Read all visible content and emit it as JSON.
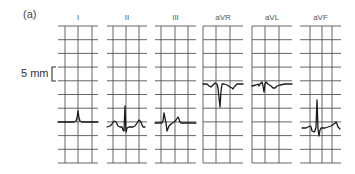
{
  "figure": {
    "label": "(a)",
    "scale_label": "5 mm",
    "colors": {
      "grid": "#555555",
      "trace": "#1a1a1a",
      "background": "#ffffff",
      "text": "#444444"
    },
    "grid": {
      "top": 26,
      "bottom": 163,
      "rows": 10,
      "row_spacing": 13.7
    },
    "scale_bracket": {
      "x": 52,
      "y_top": 67,
      "y_bottom": 81
    },
    "leads": [
      {
        "name": "I",
        "x0": 58,
        "x1": 98,
        "vlines": [
          65,
          78,
          92
        ],
        "trace": "58,122 74,122 76,121 77,118 78,111 79,118 80,121 82,122 98,122"
      },
      {
        "name": "II",
        "x0": 107,
        "x1": 147,
        "vlines": [
          113,
          126,
          139
        ],
        "trace": "107,127 110,126 112,124 114,121 116,122 118,126 120,127 122,127 123,130 124,131 125,106 126,132 127,128 129,127 133,127 135,126 137,123 139,120 141,122 142,125 143,127 145,127"
      },
      {
        "name": "III",
        "x0": 155,
        "x1": 196,
        "vlines": [
          161,
          175,
          188
        ],
        "trace": "155,123 162,123 163,121 164,113 166,123 167,131 169,126 171,124 174,122 176,120 178,117 179,119 180,122 181,123 196,123"
      },
      {
        "name": "aVR",
        "x0": 203,
        "x1": 243,
        "vlines": [
          203,
          216,
          230
        ],
        "trace": "203,84 207,84 209,86 211,87 213,85 215,83 217,84 218,88 219,98 220,107 221,91 222,84 224,84 227,85 230,87 232,88 233,89 235,86 237,84 243,84"
      },
      {
        "name": "aVL",
        "x0": 252,
        "x1": 292,
        "vlines": [
          252,
          265,
          279
        ],
        "trace": "252,86 256,85 258,84 259,86 260,84 261,83 262,82 263,86 264,92 265,84 266,82 268,84 271,86 273,88 275,88 277,86 280,85 285,84 292,84"
      },
      {
        "name": "aVF",
        "x0": 300,
        "x1": 341,
        "vlines": [
          310,
          322,
          332
        ],
        "trace": "302,128 306,128 308,127 310,126 311,127 312,131 314,132 315,131 316,127 317,100 318,129 319,136 320,130 321,128 325,128 328,127 331,126 334,124 336,122 337,124 338,127 340,129"
      }
    ]
  }
}
